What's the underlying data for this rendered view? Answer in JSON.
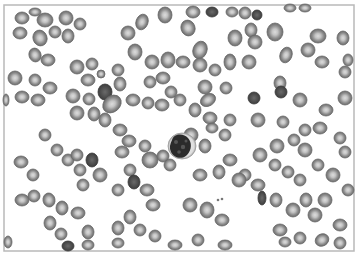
{
  "image": {
    "subject": "Blood smear micrograph",
    "description": "Grayscale light micrograph of a peripheral blood smear showing numerous red blood cells (with central pallor) and a single nucleated white blood cell near the center.",
    "colors": {
      "background": "#ffffff",
      "frame": "#b9b9b9",
      "rbc_rim": "#6f6f6f",
      "rbc_body": "#8e8e8e",
      "rbc_pallor": "#d8d8d8",
      "rbc_dense": "#4a4a4a",
      "wbc_cytoplasm": "#e6e6e6",
      "wbc_nucleus": "#2a2a2a"
    },
    "cell_types": [
      "red-blood-cell",
      "dense-red-blood-cell",
      "white-blood-cell"
    ]
  }
}
